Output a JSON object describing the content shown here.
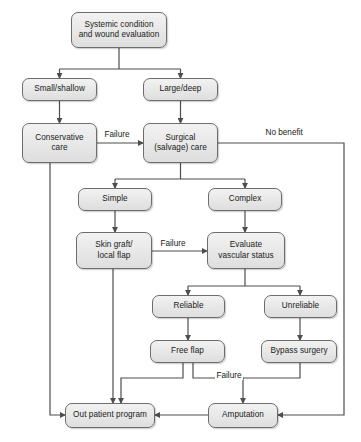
{
  "diagram": {
    "type": "flowchart",
    "stroke_color": "#4d4d4d",
    "node_fill": "#e9e9e9",
    "node_border": "#6d6d6d",
    "text_color": "#1a1a1a",
    "background": "#ffffff",
    "nodes": [
      {
        "id": "systemic",
        "label": "Systemic condition\nand wound evaluation",
        "line1": "Systemic condition",
        "line2": "and wound evaluation",
        "x": 71,
        "y": 12,
        "w": 96,
        "h": 36
      },
      {
        "id": "small",
        "label": "Small/shallow",
        "line1": "Small/shallow",
        "line2": "",
        "x": 22,
        "y": 78,
        "w": 75,
        "h": 23
      },
      {
        "id": "large",
        "label": "Large/deep",
        "line1": "Large/deep",
        "line2": "",
        "x": 143,
        "y": 78,
        "w": 75,
        "h": 23
      },
      {
        "id": "conservative",
        "label": "Conservative\ncare",
        "line1": "Conservative",
        "line2": "care",
        "x": 22,
        "y": 123,
        "w": 75,
        "h": 40
      },
      {
        "id": "surgical",
        "label": "Surgical\n(salvage) care",
        "line1": "Surgical",
        "line2": "(salvage) care",
        "x": 143,
        "y": 123,
        "w": 75,
        "h": 40
      },
      {
        "id": "simple",
        "label": "Simple",
        "line1": "Simple",
        "line2": "",
        "x": 78,
        "y": 188,
        "w": 74,
        "h": 23
      },
      {
        "id": "complex",
        "label": "Complex",
        "line1": "Complex",
        "line2": "",
        "x": 208,
        "y": 188,
        "w": 74,
        "h": 23
      },
      {
        "id": "skin-graft",
        "label": "Skin graft/\nlocal flap",
        "line1": "Skin graft/",
        "line2": "local flap",
        "x": 76,
        "y": 232,
        "w": 76,
        "h": 37
      },
      {
        "id": "evaluate",
        "label": "Evaluate\nvascular status",
        "line1": "Evaluate",
        "line2": "vascular status",
        "x": 207,
        "y": 232,
        "w": 78,
        "h": 37
      },
      {
        "id": "reliable",
        "label": "Reliable",
        "line1": "Reliable",
        "line2": "",
        "x": 152,
        "y": 295,
        "w": 73,
        "h": 23
      },
      {
        "id": "unreliable",
        "label": "Unreliable",
        "line1": "Unreliable",
        "line2": "",
        "x": 264,
        "y": 295,
        "w": 73,
        "h": 23
      },
      {
        "id": "free-flap",
        "label": "Free flap",
        "line1": "Free flap",
        "line2": "",
        "x": 150,
        "y": 340,
        "w": 75,
        "h": 23
      },
      {
        "id": "bypass",
        "label": "Bypass surgery",
        "line1": "Bypass surgery",
        "line2": "",
        "x": 261,
        "y": 340,
        "w": 76,
        "h": 23
      },
      {
        "id": "outpatient",
        "label": "Out patient program",
        "line1": "Out patient program",
        "line2": "",
        "x": 65,
        "y": 403,
        "w": 90,
        "h": 25
      },
      {
        "id": "amputation",
        "label": "Amputation",
        "line1": "Amputation",
        "line2": "",
        "x": 208,
        "y": 403,
        "w": 70,
        "h": 25
      }
    ],
    "edge_labels": [
      {
        "id": "failure-1",
        "text": "Failure",
        "x": 103,
        "y": 130
      },
      {
        "id": "no-benefit",
        "text": "No benefit",
        "x": 264,
        "y": 128
      },
      {
        "id": "failure-2",
        "text": "Failure",
        "x": 159,
        "y": 239
      },
      {
        "id": "failure-3",
        "text": "Failure",
        "x": 215,
        "y": 371
      }
    ]
  }
}
